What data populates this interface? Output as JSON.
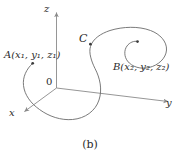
{
  "figure": {
    "caption": "(b)",
    "axes": [
      {
        "name": "z",
        "label": "z"
      },
      {
        "name": "y",
        "label": "y"
      },
      {
        "name": "x",
        "label": "x"
      }
    ],
    "origin_label": "0",
    "points": [
      {
        "id": "A",
        "name": "A",
        "coords": "(x₁, y₁, z₁)",
        "label": "A(x₁, y₁, z₁)"
      },
      {
        "id": "B",
        "name": "B",
        "coords": "(x₂, y₂, z₂)",
        "label": "B(x₂, y₂, z₂)"
      },
      {
        "id": "C",
        "name": "C",
        "coords": "",
        "label": "C"
      }
    ],
    "colors": {
      "curve": "#6b6b6b",
      "axis": "#8a8a8a",
      "text": "#2b2b2b",
      "background": "#ffffff",
      "point_marker": "#3a3a3a"
    }
  }
}
